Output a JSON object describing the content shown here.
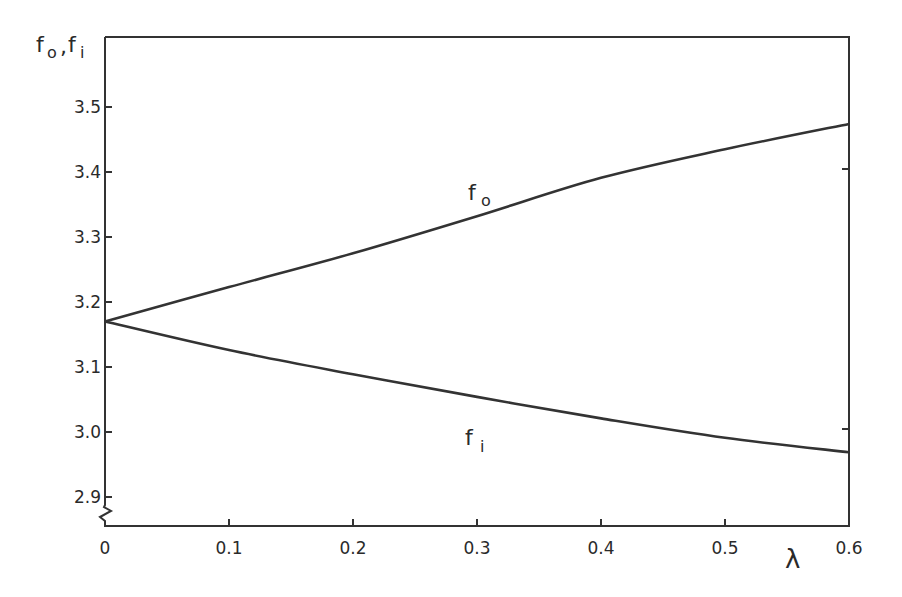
{
  "chart_data": {
    "type": "line",
    "title": "",
    "xlabel": "λ",
    "ylabel": "fo, fi",
    "ylabel_parts": {
      "main1": "f",
      "sub1": "o",
      "sep": ",",
      "main2": "f",
      "sub2": "i"
    },
    "xlim": [
      0,
      0.6
    ],
    "ylim": [
      2.9,
      3.55
    ],
    "y_axis_break": true,
    "grid": false,
    "legend": "inline labels",
    "x_ticks": [
      0,
      0.1,
      0.2,
      0.3,
      0.4,
      0.5,
      0.6
    ],
    "x_tick_labels": [
      "0",
      "0.1",
      "0.2",
      "0.3",
      "0.4",
      "0.5",
      "0.6"
    ],
    "y_ticks": [
      2.9,
      3.0,
      3.1,
      3.2,
      3.3,
      3.4,
      3.5
    ],
    "y_tick_labels": [
      "2.9",
      "3.0",
      "3.1",
      "3.2",
      "3.3",
      "3.4",
      "3.5"
    ],
    "x": [
      0,
      0.1,
      0.2,
      0.3,
      0.4,
      0.5,
      0.6
    ],
    "series": [
      {
        "name": "fo",
        "label_main": "f",
        "label_sub": "o",
        "values": [
          3.17,
          3.223,
          3.275,
          3.332,
          3.391,
          3.435,
          3.474
        ],
        "label_at": [
          0.298,
          3.36
        ]
      },
      {
        "name": "fi",
        "label_main": "f",
        "label_sub": "i",
        "values": [
          3.17,
          3.126,
          3.089,
          3.054,
          3.021,
          2.991,
          2.969
        ],
        "label_at": [
          0.295,
          2.975
        ]
      }
    ]
  }
}
